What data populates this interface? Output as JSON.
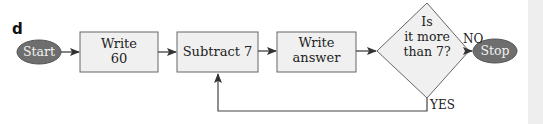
{
  "figure_label": "d",
  "nodes": {
    "start": {
      "label": "Start",
      "shape": "ellipse"
    },
    "write60": {
      "line1": "Write",
      "line2": "60",
      "shape": "rectangle"
    },
    "subtract": {
      "label": "Subtract 7",
      "shape": "rectangle"
    },
    "write_answer": {
      "line1": "Write",
      "line2": "answer",
      "shape": "rectangle"
    },
    "decision": {
      "line1": "Is",
      "line2": "it more",
      "line3": "than 7?",
      "shape": "diamond"
    },
    "stop": {
      "label": "Stop",
      "shape": "ellipse"
    }
  },
  "edges": {
    "no_label": "NO",
    "yes_label": "YES"
  },
  "colors": {
    "terminal_fill": "#6e6e6e",
    "box_fill": "#f0f0f0",
    "stroke": "#555555"
  }
}
